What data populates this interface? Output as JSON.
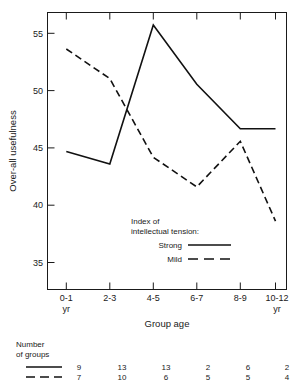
{
  "chart_data": {
    "type": "line",
    "title": "",
    "xlabel": "Group age",
    "ylabel": "Over-all usefulness",
    "categories": [
      "0-1",
      "2-3",
      "4-5",
      "6-7",
      "8-9",
      "10-12"
    ],
    "x_tick_sub_first": "yr",
    "x_tick_sub_last": "yr",
    "y_ticks": [
      35,
      40,
      45,
      50,
      55
    ],
    "ylim": [
      33.0,
      57.3
    ],
    "grid": false,
    "legend_position": "inside-lower-center",
    "series": [
      {
        "name": "Strong",
        "style": "solid",
        "values": [
          45.1,
          44.0,
          56.2,
          51.0,
          47.1,
          47.1
        ]
      },
      {
        "name": "Mild",
        "style": "dashed",
        "values": [
          54.1,
          51.5,
          44.6,
          42.0,
          46.0,
          39.0
        ]
      }
    ]
  },
  "axes": {
    "y_title": "Over-all usefulness",
    "x_title": "Group age",
    "y_tick_labels": [
      "55",
      "50",
      "45",
      "40",
      "35"
    ],
    "x_tick_labels": [
      "0-1",
      "2-3",
      "4-5",
      "6-7",
      "8-9",
      "10-12"
    ],
    "x_tick_units": {
      "first": "yr",
      "last": "yr"
    }
  },
  "legend": {
    "title_line1": "Index of",
    "title_line2": "intellectual tension:",
    "entries": [
      {
        "label": "Strong",
        "style": "solid"
      },
      {
        "label": "Mild",
        "style": "dashed"
      }
    ]
  },
  "footer_table": {
    "title_line1": "Number",
    "title_line2": "of groups",
    "rows": [
      {
        "style": "solid",
        "values": [
          "9",
          "13",
          "13",
          "2",
          "6",
          "2"
        ]
      },
      {
        "style": "dashed",
        "values": [
          "7",
          "10",
          "6",
          "5",
          "5",
          "4"
        ]
      }
    ]
  },
  "colors": {
    "ink": "#1a1a1a",
    "line": "#111111",
    "background": "#ffffff"
  }
}
